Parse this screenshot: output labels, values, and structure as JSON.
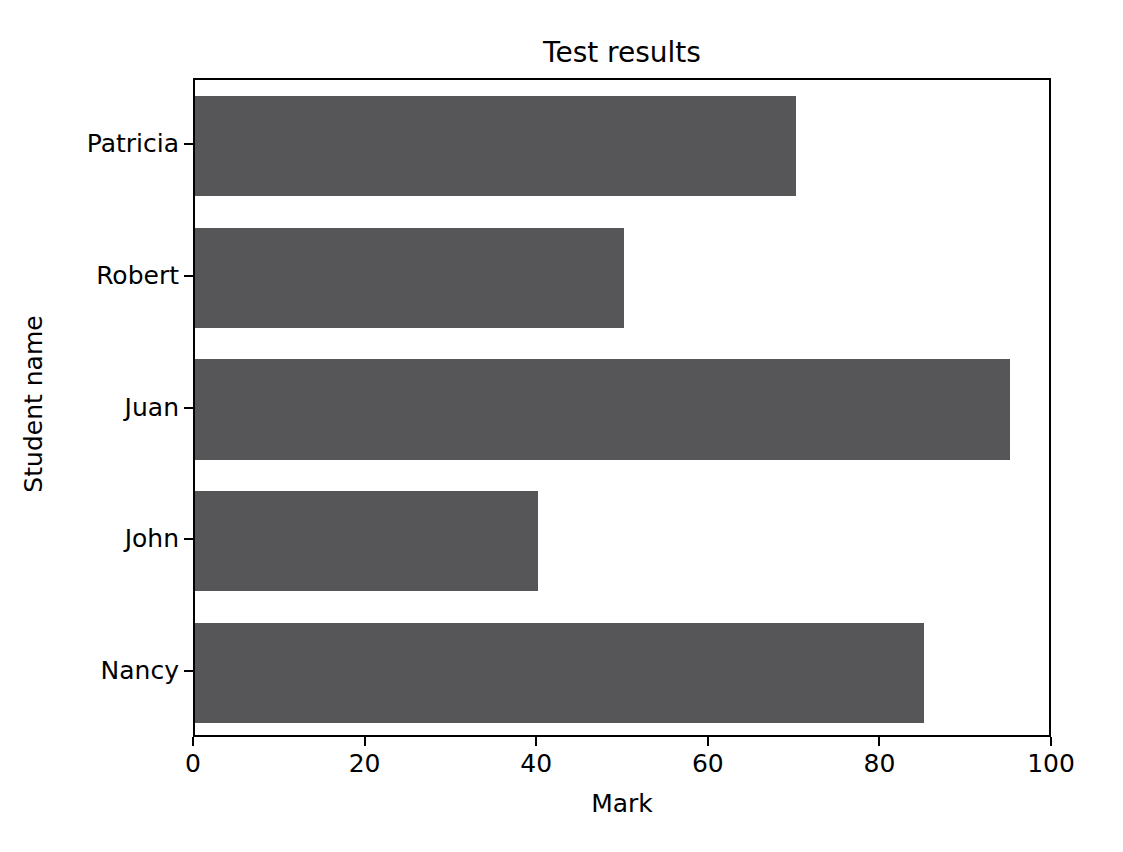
{
  "chart_data": {
    "type": "bar",
    "orientation": "horizontal",
    "title": "Test results",
    "xlabel": "Mark",
    "ylabel": "Student name",
    "categories": [
      "Nancy",
      "John",
      "Juan",
      "Robert",
      "Patricia"
    ],
    "values": [
      85,
      40,
      95,
      50,
      70
    ],
    "xlim": [
      0,
      100
    ],
    "xticks": [
      0,
      20,
      40,
      60,
      80,
      100
    ],
    "xtick_labels": [
      "0",
      "20",
      "40",
      "60",
      "80",
      "100"
    ],
    "ytick_labels": [
      "Nancy",
      "John",
      "Juan",
      "Robert",
      "Patricia"
    ],
    "grid": false,
    "legend": null,
    "bar_color": "#565658",
    "background_color": "#ffffff",
    "axis_color": "#000000",
    "points": [
      {
        "category": "Patricia",
        "value": 70
      },
      {
        "category": "Robert",
        "value": 50
      },
      {
        "category": "Juan",
        "value": 95
      },
      {
        "category": "John",
        "value": 40
      },
      {
        "category": "Nancy",
        "value": 85
      }
    ]
  }
}
